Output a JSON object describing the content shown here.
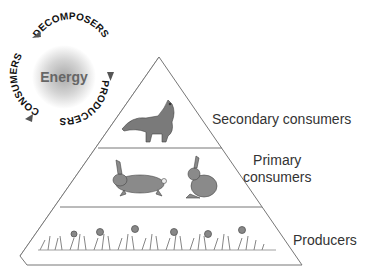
{
  "cycle": {
    "center_label": "Energy",
    "stages": [
      "DECOMPOSERS",
      "PRODUCERS",
      "CONSUMERS"
    ],
    "arrow_color": "#555555"
  },
  "pyramid": {
    "levels": [
      {
        "label": "Secondary consumers",
        "organisms": [
          "fox"
        ]
      },
      {
        "label_line1": "Primary",
        "label_line2": "consumers",
        "organisms": [
          "rabbit",
          "rabbit"
        ]
      },
      {
        "label": "Producers",
        "organisms": [
          "grass",
          "flowers"
        ]
      }
    ]
  }
}
